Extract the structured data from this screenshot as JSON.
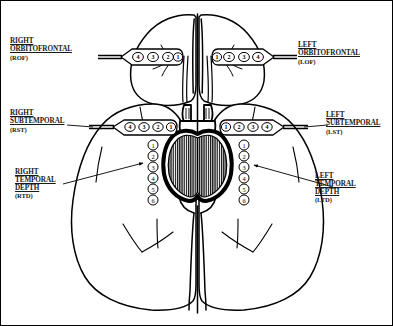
{
  "figure": {
    "view": "ventral (inferior) brain surface",
    "ink_color": "#000000",
    "background_color": "#ffffff",
    "border_color": "#000000"
  },
  "labels": {
    "rof": {
      "line1": "RIGHT",
      "line2": "ORBITOFRONTAL",
      "abbr": "(ROF)"
    },
    "lof": {
      "line1": "LEFT",
      "line2": "ORBITOFRONTAL",
      "abbr": "(LOF)"
    },
    "rst": {
      "line1": "RIGHT",
      "line2": "SUBTEMPORAL",
      "abbr": "(RST)"
    },
    "lst": {
      "line1": "LEFT",
      "line2": "SUBTEMPORAL",
      "abbr": "(LST)"
    },
    "rtd": {
      "line1": "RIGHT",
      "line2": "TEMPORAL",
      "line3": "DEPTH",
      "abbr": "(RTD)"
    },
    "ltd": {
      "line1": "LEFT",
      "line2": "TEMPORAL",
      "line3": "DEPTH",
      "abbr": "(LTD)"
    }
  },
  "electrodes": {
    "rof_strip": {
      "name": "right-orbitofrontal-strip",
      "contacts": [
        "4",
        "3",
        "2",
        "1"
      ]
    },
    "lof_strip": {
      "name": "left-orbitofrontal-strip",
      "contacts": [
        "1",
        "2",
        "3",
        "4"
      ]
    },
    "rst_strip": {
      "name": "right-subtemporal-strip",
      "contacts": [
        "4",
        "3",
        "2",
        "1"
      ]
    },
    "lst_strip": {
      "name": "left-subtemporal-strip",
      "contacts": [
        "1",
        "2",
        "3",
        "4"
      ]
    },
    "rtd_depth": {
      "name": "right-temporal-depth-array",
      "contacts": [
        "1",
        "2",
        "3",
        "4",
        "5",
        "6"
      ]
    },
    "ltd_depth": {
      "name": "left-temporal-depth-array",
      "contacts": [
        "1",
        "2",
        "3",
        "4",
        "5",
        "6"
      ]
    }
  },
  "anatomy": {
    "frontal_lobes": "frontal lobes",
    "temporal_lobes": "temporal lobes",
    "occipital_lobes": "occipital lobes",
    "brainstem": "brainstem",
    "cerebellum": "cerebellum",
    "interhemispheric_fissure": "interhemispheric fissure",
    "olfactory_tracts": "olfactory tracts"
  }
}
